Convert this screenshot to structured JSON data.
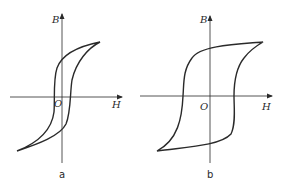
{
  "figure": {
    "panels": [
      {
        "id": "a",
        "caption": "a",
        "y_axis_label": "B",
        "x_axis_label": "H",
        "origin_label": "O",
        "description": "Narrow hysteresis loop (soft magnetic material)"
      },
      {
        "id": "b",
        "caption": "b",
        "y_axis_label": "B",
        "x_axis_label": "H",
        "origin_label": "O",
        "description": "Wide hysteresis loop (hard magnetic material)"
      }
    ],
    "colors": {
      "line": "#2a2a2a",
      "background": "#ffffff"
    }
  }
}
